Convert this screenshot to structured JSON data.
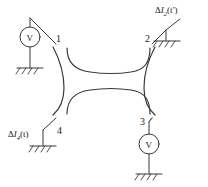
{
  "figure": {
    "background_color": "#ffffff",
    "line_color": "#3a3a3a",
    "text_color": "#1a1a1a"
  },
  "nodes": [
    {
      "id": "1",
      "label": "1",
      "position": "top-left"
    },
    {
      "id": "2",
      "label": "2",
      "position": "top-right"
    },
    {
      "id": "3",
      "label": "3",
      "position": "bottom-right"
    },
    {
      "id": "4",
      "label": "4",
      "position": "bottom-left"
    }
  ],
  "meters": [
    {
      "id": "voltmeter-1",
      "label": "V",
      "terminal": "1"
    },
    {
      "id": "voltmeter-3",
      "label": "V",
      "terminal": "3"
    }
  ],
  "sources": [
    {
      "id": "current-source-2",
      "delta": "Δ",
      "symbol": "I",
      "subscript": "2",
      "argument": "(t′)",
      "full_label": "ΔI2(t′)",
      "terminal": "2"
    },
    {
      "id": "current-source-4",
      "delta": "Δ",
      "symbol": "I",
      "subscript": "4",
      "argument": "(t)",
      "full_label": "ΔI4(t)",
      "terminal": "4"
    }
  ],
  "grounds": [
    {
      "id": "ground-1",
      "terminal": "1"
    },
    {
      "id": "ground-2",
      "terminal": "2"
    },
    {
      "id": "ground-3",
      "terminal": "3"
    },
    {
      "id": "ground-4",
      "terminal": "4"
    }
  ],
  "conductor": {
    "shape": "cross-junction-constriction",
    "description": "four-lead mesoscopic conductor with central narrow constriction"
  }
}
